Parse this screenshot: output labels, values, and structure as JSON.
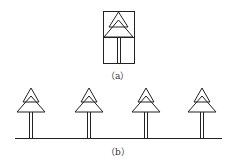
{
  "labels": {
    "a": "（a）",
    "b": "（b）"
  },
  "stroke_color": "#222222",
  "trees_b_x": [
    31,
    89,
    146,
    202
  ]
}
